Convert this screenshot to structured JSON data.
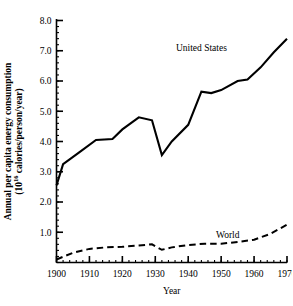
{
  "chart_data": {
    "type": "line",
    "title": "",
    "xlabel": "Year",
    "ylabel_line1": "Annual per capita energy consumption",
    "ylabel_line2_pre": "(10",
    "ylabel_line2_sup": "16",
    "ylabel_line2_post": " calories/person/year)",
    "ylabel_full": "Annual per capita energy consumption (10^16 calories/person/year)",
    "xlim": [
      1900,
      1970
    ],
    "ylim": [
      0,
      8
    ],
    "xticks": [
      1900,
      1910,
      1920,
      1930,
      1940,
      1950,
      1960,
      1970
    ],
    "xtick_labels": [
      "1900",
      "1910",
      "1920",
      "1930",
      "1940",
      "1950",
      "1960",
      "1970"
    ],
    "yticks": [
      1,
      2,
      3,
      4,
      5,
      6,
      7,
      8
    ],
    "ytick_labels": [
      "1.0",
      "2.0",
      "3.0",
      "4.0",
      "5.0",
      "6.0",
      "7.0",
      "8.0"
    ],
    "minor_ytick_step": 0.2,
    "grid": false,
    "legend_position": "inline-annotations",
    "series": [
      {
        "name": "United States",
        "style": "solid",
        "color": "#000000",
        "annotation": "United States",
        "annotation_x": 1944,
        "annotation_y": 7.0,
        "x": [
          1900,
          1902,
          1907,
          1912,
          1917,
          1920,
          1925,
          1929,
          1932,
          1935,
          1940,
          1944,
          1947,
          1950,
          1955,
          1958,
          1962,
          1966,
          1970
        ],
        "y": [
          2.55,
          3.25,
          3.65,
          4.05,
          4.08,
          4.4,
          4.8,
          4.7,
          3.55,
          4.0,
          4.55,
          5.65,
          5.6,
          5.7,
          6.0,
          6.05,
          6.45,
          6.95,
          7.4
        ]
      },
      {
        "name": "World",
        "style": "dashed",
        "color": "#000000",
        "annotation": "World",
        "annotation_x": 1952,
        "annotation_y": 0.8,
        "x": [
          1900,
          1905,
          1910,
          1915,
          1920,
          1925,
          1929,
          1932,
          1935,
          1940,
          1945,
          1950,
          1955,
          1960,
          1965,
          1970
        ],
        "y": [
          0.1,
          0.32,
          0.45,
          0.5,
          0.52,
          0.56,
          0.6,
          0.42,
          0.5,
          0.58,
          0.62,
          0.62,
          0.68,
          0.75,
          0.95,
          1.25
        ]
      }
    ]
  }
}
